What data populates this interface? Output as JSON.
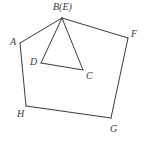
{
  "figure": {
    "type": "geometry-diagram",
    "canvas": {
      "width": 144,
      "height": 146
    },
    "background_color": "#fefefe",
    "stroke_color": "#3b3b3b",
    "stroke_width": 1,
    "points": {
      "B": {
        "label": "B(E)",
        "x": 62,
        "y": 18
      },
      "A": {
        "label": "A",
        "x": 20,
        "y": 43
      },
      "F": {
        "label": "F",
        "x": 128,
        "y": 38
      },
      "D": {
        "label": "D",
        "x": 41,
        "y": 63
      },
      "C": {
        "label": "C",
        "x": 83,
        "y": 70
      },
      "H": {
        "label": "H",
        "x": 26,
        "y": 106
      },
      "G": {
        "label": "G",
        "x": 111,
        "y": 118
      }
    },
    "segments": [
      {
        "name": "A-B",
        "from": "A",
        "to": "B"
      },
      {
        "name": "B-F",
        "from": "B",
        "to": "F"
      },
      {
        "name": "F-G",
        "from": "F",
        "to": "G"
      },
      {
        "name": "G-H",
        "from": "G",
        "to": "H"
      },
      {
        "name": "H-A",
        "from": "H",
        "to": "A"
      },
      {
        "name": "B-D",
        "from": "B",
        "to": "D"
      },
      {
        "name": "B-C",
        "from": "B",
        "to": "C"
      },
      {
        "name": "D-C",
        "from": "D",
        "to": "C"
      }
    ],
    "labels": {
      "B": "B(E)",
      "A": "A",
      "F": "F",
      "D": "D",
      "C": "C",
      "H": "H",
      "G": "G"
    }
  }
}
